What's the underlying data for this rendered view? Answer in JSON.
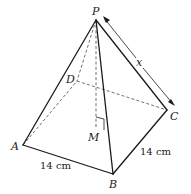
{
  "diagram": {
    "type": "square-based pyramid",
    "vertices": {
      "P": {
        "label": "P",
        "x": 96,
        "y": 20
      },
      "A": {
        "label": "A",
        "x": 23,
        "y": 145
      },
      "B": {
        "label": "B",
        "x": 113,
        "y": 174
      },
      "C": {
        "label": "C",
        "x": 167,
        "y": 110
      },
      "D": {
        "label": "D",
        "x": 77,
        "y": 81
      },
      "M": {
        "label": "M",
        "x": 96,
        "y": 128
      }
    },
    "labels": {
      "P": "P",
      "A": "A",
      "B": "B",
      "C": "C",
      "D": "D",
      "M": "M",
      "x": "x",
      "ab_length": "14 cm",
      "bc_length": "14 cm"
    },
    "visible_edges": [
      "PA",
      "PB",
      "PC",
      "AB",
      "BC"
    ],
    "hidden_edges": [
      "PD",
      "AD",
      "DC",
      "PM"
    ],
    "annotations": {
      "right_angle_at": "M",
      "dimension_arrow": "PC labelled x"
    },
    "colors": {
      "line": "#1a1a1a",
      "dashed": "#4a4a4a",
      "background": "#ffffff"
    }
  }
}
